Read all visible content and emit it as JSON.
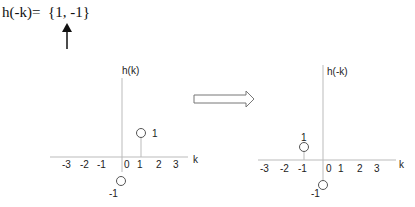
{
  "equation": {
    "text": "h(-k)=  {1, -1}",
    "pointer_arrow": "up-arrow under -1"
  },
  "left_plot": {
    "ylabel": "h(k)",
    "xlabel": "k",
    "ticks": [
      "-3",
      "-2",
      "-1",
      "0",
      "1",
      "2",
      "3"
    ],
    "points": [
      {
        "k": 0,
        "value": -1,
        "label": "-1"
      },
      {
        "k": 1,
        "value": 1,
        "label": "1"
      }
    ]
  },
  "transform_arrow": {
    "icon": "right-hollow-arrow-icon"
  },
  "right_plot": {
    "ylabel": "h(-k)",
    "xlabel": "k",
    "ticks": [
      "-3",
      "-2",
      "-1",
      "0",
      "1",
      "2",
      "3"
    ],
    "points": [
      {
        "k": -1,
        "value": 1,
        "label": "1"
      },
      {
        "k": 0,
        "value": -1,
        "label": "-1"
      }
    ]
  }
}
